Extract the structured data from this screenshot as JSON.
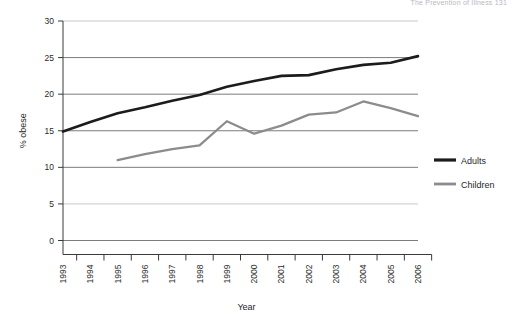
{
  "header": {
    "running_head": "The Prevention of Illness 131"
  },
  "chart_data": {
    "type": "line",
    "title": "",
    "xlabel": "Year",
    "ylabel": "% obese",
    "categories": [
      "1993",
      "1994",
      "1995",
      "1996",
      "1997",
      "1998",
      "1999",
      "2000",
      "2001",
      "2002",
      "2003",
      "2004",
      "2005",
      "2006"
    ],
    "x": [
      1993,
      1994,
      1995,
      1996,
      1997,
      1998,
      1999,
      2000,
      2001,
      2002,
      2003,
      2004,
      2005,
      2006
    ],
    "ylim": [
      0,
      30
    ],
    "yticks": [
      0,
      5,
      10,
      15,
      20,
      25,
      30
    ],
    "grid": true,
    "legend_position": "right",
    "series": [
      {
        "name": "Adults",
        "color": "#1c1c1c",
        "values": [
          14.9,
          16.2,
          17.4,
          18.2,
          19.1,
          19.9,
          21.0,
          21.8,
          22.5,
          22.6,
          23.4,
          24.0,
          24.3,
          25.2
        ]
      },
      {
        "name": "Children",
        "color": "#8c8c8c",
        "values": [
          null,
          null,
          11.0,
          11.8,
          12.5,
          13.0,
          16.3,
          14.6,
          15.7,
          17.2,
          17.5,
          19.0,
          18.1,
          17.0
        ]
      }
    ]
  },
  "legend": {
    "items": [
      {
        "label": "Adults",
        "color": "#1c1c1c"
      },
      {
        "label": "Children",
        "color": "#8c8c8c"
      }
    ]
  },
  "axes": {
    "y_tick_labels": [
      "30",
      "25",
      "20",
      "15",
      "10",
      "5",
      "0"
    ],
    "x_tick_labels": [
      "1993",
      "1994",
      "1995",
      "1996",
      "1997",
      "1998",
      "1999",
      "2000",
      "2001",
      "2002",
      "2003",
      "2004",
      "2005",
      "2006"
    ],
    "y_axis_title": "% obese",
    "x_axis_title": "Year"
  }
}
